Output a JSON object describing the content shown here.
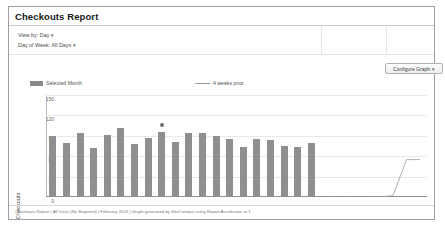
{
  "panel": {
    "title": "Checkouts Report"
  },
  "filters": {
    "view_by": "View by: Day",
    "day_of_week": "Day of Week: All Days",
    "caret": "▾"
  },
  "toolbar": {
    "configure_graph_label": "Configure Graph",
    "caret": "▾"
  },
  "legend": {
    "selected_month": "Selected Month",
    "four_weeks_prior": "4 weeks prior"
  },
  "footer": {
    "citation": "Checkouts Report | All Visits (No Segment) | February 2013 | Graph generated by SiteCatalyst using Report Accelerator at  1"
  },
  "colors": {
    "bar": "#8f8f8f",
    "line": "#9c9c9c",
    "grid": "#e8e8e8",
    "axis": "#8c8c8c",
    "panel_border": "#9aa0a6"
  },
  "chart_data": {
    "type": "bar",
    "title": "",
    "xlabel": "Feb 2013",
    "ylabel": "Checkouts",
    "ylim": [
      0,
      150
    ],
    "yticks": [
      0,
      30,
      60,
      90,
      120,
      150
    ],
    "grid": true,
    "legend_position": "top",
    "categories": [
      "1",
      "2",
      "3",
      "4",
      "5",
      "6",
      "7",
      "8",
      "9",
      "10",
      "11",
      "12",
      "13",
      "14",
      "15",
      "16",
      "17",
      "18",
      "19",
      "20",
      "21",
      "22",
      "23",
      "24",
      "25",
      "26",
      "27",
      "28"
    ],
    "series": [
      {
        "name": "Selected Month",
        "type": "bar",
        "values": [
          88,
          78,
          92,
          70,
          89,
          100,
          76,
          86,
          94,
          80,
          92,
          92,
          88,
          84,
          72,
          84,
          82,
          74,
          72,
          78,
          0,
          0,
          0,
          0,
          0,
          0,
          0,
          0
        ]
      },
      {
        "name": "4 weeks prior",
        "type": "line",
        "values": [
          0,
          0,
          0,
          0,
          0,
          0,
          0,
          0,
          0,
          0,
          0,
          0,
          0,
          0,
          0,
          0,
          0,
          0,
          0,
          0,
          0,
          0,
          0,
          0,
          0,
          2,
          55,
          55
        ]
      }
    ],
    "annotations": [
      {
        "name": "data-point-marker",
        "x": "9",
        "y": 106
      }
    ]
  }
}
